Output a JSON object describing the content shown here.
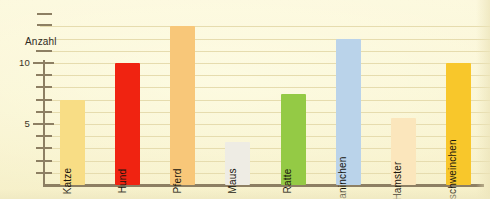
{
  "chart_data": {
    "type": "bar",
    "title": "",
    "subtitle": "",
    "xlabel": "",
    "ylabel": "Anzahl",
    "ylim": [
      0,
      14
    ],
    "grid": true,
    "legend": false,
    "axis_break": true,
    "categories": [
      "Katze",
      "Hund",
      "Pferd",
      "Maus",
      "Ratte",
      "Kaninchen",
      "Hamster",
      "Meerschweinchen"
    ],
    "values": [
      7,
      10,
      13,
      3.5,
      7.5,
      12,
      5.5,
      10
    ],
    "bar_colors": [
      "#f8dd85",
      "#f02311",
      "#f8c779",
      "#eeece4",
      "#94ca45",
      "#bad3ea",
      "#fbe6bc",
      "#f8c72b"
    ],
    "tick_labels": [
      "5",
      "10"
    ],
    "tick_values": [
      5,
      10
    ],
    "minor_tick_values": [
      1,
      2,
      3,
      4,
      6,
      7,
      8,
      9,
      11
    ],
    "gridline_values": [
      1,
      2,
      3,
      4,
      5,
      6,
      7,
      8,
      9,
      10,
      11,
      12,
      13
    ],
    "colors": {
      "background": "#fbf6d8",
      "axis": "#8d7f63",
      "gridline": "#e6dcae",
      "text": "#2e2a1f"
    }
  }
}
